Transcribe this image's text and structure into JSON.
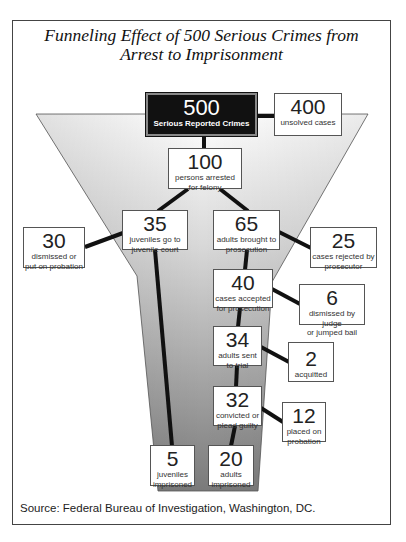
{
  "title": {
    "line1": "Funneling Effect of 500 Serious Crimes from",
    "line2": "Arrest to Imprisonment"
  },
  "nodes": {
    "reported": {
      "value": "500",
      "label": "Serious Reported Crimes"
    },
    "unsolved": {
      "value": "400",
      "label": "unsolved cases"
    },
    "arrested": {
      "value": "100",
      "label_1": "persons arrested",
      "label_2": "for felony"
    },
    "juveniles": {
      "value": "35",
      "label_1": "juveniles go to",
      "label_2": "juvenile court"
    },
    "adults": {
      "value": "65",
      "label_1": "adults brought to",
      "label_2": "prosecution"
    },
    "dismissed_probation": {
      "value": "30",
      "label_1": "dismissed or",
      "label_2": "put on probation"
    },
    "rejected": {
      "value": "25",
      "label_1": "cases rejected by",
      "label_2": "prosecutor"
    },
    "accepted": {
      "value": "40",
      "label_1": "cases accepted",
      "label_2": "for prosecution"
    },
    "dismissed_judge": {
      "value": "6",
      "label_1": "dismissed by judge",
      "label_2": "or jumped bail"
    },
    "trial": {
      "value": "34",
      "label_1": "adults sent",
      "label_2": "to trial"
    },
    "acquitted": {
      "value": "2",
      "label_1": "acquitted"
    },
    "convicted": {
      "value": "32",
      "label_1": "convicted or",
      "label_2": "plead guilty"
    },
    "probation": {
      "value": "12",
      "label_1": "placed on",
      "label_2": "probation"
    },
    "juveniles_imprisoned": {
      "value": "5",
      "label_1": "juveniles",
      "label_2": "imprisoned"
    },
    "adults_imprisoned": {
      "value": "20",
      "label_1": "adults",
      "label_2": "imprisoned"
    }
  },
  "source": "Source: Federal Bureau of Investigation, Washington, DC.",
  "colors": {
    "dark_box": "#111111",
    "connector": "#111111",
    "funnel_top": "#ffffff",
    "funnel_bottom": "#777777"
  }
}
